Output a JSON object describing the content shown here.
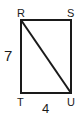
{
  "diagram": {
    "shape": "rectangle",
    "vertices": {
      "top_left": "R",
      "top_right": "S",
      "bottom_left": "T",
      "bottom_right": "U"
    },
    "diagonal": "RU",
    "side_lengths": {
      "left": "7",
      "bottom": "4"
    },
    "stroke_color": "#1a1a1a"
  }
}
